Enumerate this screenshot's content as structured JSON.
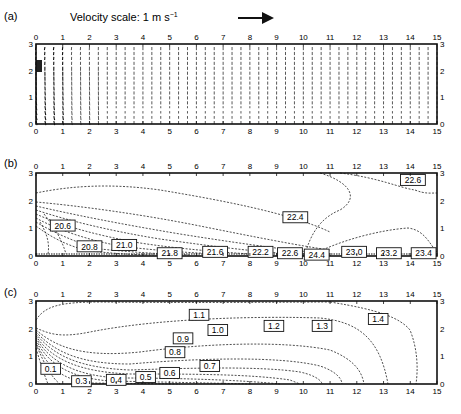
{
  "figure": {
    "panels": [
      "(a)",
      "(b)",
      "(c)"
    ],
    "velocity_scale_label": "Velocity scale: 1 m s",
    "velocity_scale_exp": "−1",
    "x_ticks": [
      "0",
      "1",
      "2",
      "3",
      "4",
      "5",
      "6",
      "7",
      "8",
      "9",
      "10",
      "11",
      "12",
      "13",
      "14",
      "15"
    ],
    "y_ticks": [
      "0",
      "1",
      "2",
      "3"
    ]
  },
  "chart_data": [
    {
      "panel": "(a)",
      "type": "vector-field",
      "title": "Velocity field",
      "annotation": "Velocity scale: 1 m s^-1 (reference arrow)",
      "xlim": [
        0,
        15
      ],
      "ylim": [
        0,
        3
      ],
      "x_ticks": [
        0,
        1,
        2,
        3,
        4,
        5,
        6,
        7,
        8,
        9,
        10,
        11,
        12,
        13,
        14,
        15
      ],
      "y_ticks": [
        0,
        1,
        2,
        3
      ],
      "ticks_on": [
        "top",
        "bottom",
        "left",
        "right"
      ],
      "description": "Dense vertical arrows over the domain; strong recirculating inflow near x=0, y≈1.5-2.5; arrows converge toward bottom near x≈1-3"
    },
    {
      "panel": "(b)",
      "type": "contour",
      "title": "Temperature contours",
      "xlim": [
        0,
        15
      ],
      "ylim": [
        0,
        3
      ],
      "x_ticks": [
        0,
        1,
        2,
        3,
        4,
        5,
        6,
        7,
        8,
        9,
        10,
        11,
        12,
        13,
        14,
        15
      ],
      "y_ticks": [
        0,
        1,
        2,
        3
      ],
      "contour_labels": [
        {
          "value": "20.6",
          "x": 1.0,
          "y": 1.1
        },
        {
          "value": "20.8",
          "x": 2.0,
          "y": 0.35
        },
        {
          "value": "21.0",
          "x": 3.3,
          "y": 0.4
        },
        {
          "value": "21.8",
          "x": 5.0,
          "y": 0.1
        },
        {
          "value": "21.6",
          "x": 6.7,
          "y": 0.15
        },
        {
          "value": "22.2",
          "x": 8.4,
          "y": 0.15
        },
        {
          "value": "22.6",
          "x": 9.5,
          "y": 0.1
        },
        {
          "value": "22.4",
          "x": 9.7,
          "y": 1.4
        },
        {
          "value": "24.4",
          "x": 10.5,
          "y": 0.05
        },
        {
          "value": "23.0",
          "x": 11.9,
          "y": 0.15
        },
        {
          "value": "23.2",
          "x": 13.2,
          "y": 0.1
        },
        {
          "value": "23.4",
          "x": 14.5,
          "y": 0.1
        },
        {
          "value": "22.6",
          "x": 14.1,
          "y": 2.75
        }
      ]
    },
    {
      "panel": "(c)",
      "type": "contour",
      "title": "Scalar contours",
      "xlim": [
        0,
        15
      ],
      "ylim": [
        0,
        3
      ],
      "x_ticks": [
        0,
        1,
        2,
        3,
        4,
        5,
        6,
        7,
        8,
        9,
        10,
        11,
        12,
        13,
        14,
        15
      ],
      "y_ticks": [
        0,
        1,
        2,
        3
      ],
      "contour_labels": [
        {
          "value": "0.1",
          "x": 0.55,
          "y": 0.55
        },
        {
          "value": "0.3",
          "x": 1.7,
          "y": 0.1
        },
        {
          "value": "0.4",
          "x": 3.0,
          "y": 0.15
        },
        {
          "value": "0.5",
          "x": 4.1,
          "y": 0.25
        },
        {
          "value": "0.6",
          "x": 5.0,
          "y": 0.4
        },
        {
          "value": "0.7",
          "x": 6.5,
          "y": 0.65
        },
        {
          "value": "0.8",
          "x": 5.2,
          "y": 1.15
        },
        {
          "value": "0.9",
          "x": 5.5,
          "y": 1.65
        },
        {
          "value": "1.0",
          "x": 6.8,
          "y": 1.95
        },
        {
          "value": "1.1",
          "x": 6.1,
          "y": 2.5
        },
        {
          "value": "1.2",
          "x": 8.9,
          "y": 2.1
        },
        {
          "value": "1.3",
          "x": 10.7,
          "y": 2.1
        },
        {
          "value": "1.4",
          "x": 12.8,
          "y": 2.35
        }
      ]
    }
  ]
}
